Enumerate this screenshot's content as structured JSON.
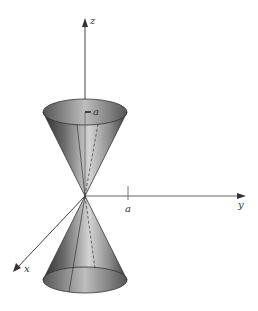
{
  "figure": {
    "axes": {
      "x_label": "x",
      "y_label": "y",
      "z_label": "z"
    },
    "annotations": {
      "upper_radius_label": "a",
      "y_tick_label": "a"
    },
    "colors": {
      "axis": "#444444",
      "cone_dark": "#3a3a3a",
      "cone_light": "#d8d8d8",
      "background": "#ffffff"
    }
  }
}
